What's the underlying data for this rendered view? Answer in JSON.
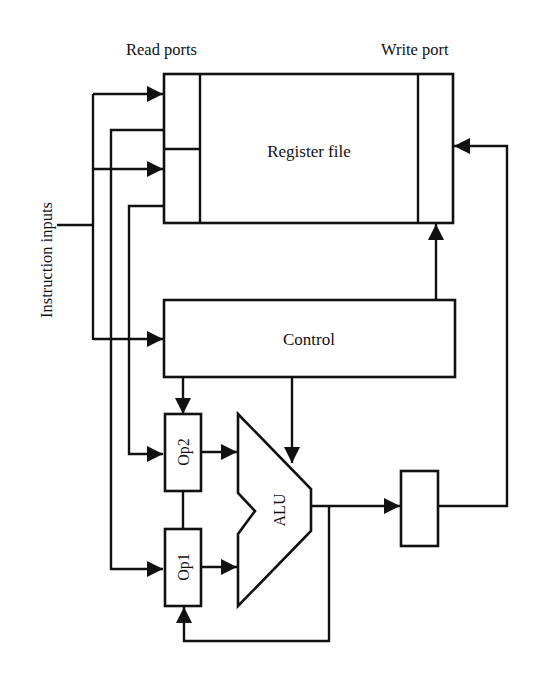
{
  "diagram": {
    "type": "block-diagram",
    "labels": {
      "read_ports": "Read ports",
      "write_port": "Write port",
      "instruction_inputs": "Instruction inputs",
      "register_file": "Register file",
      "control": "Control",
      "op1": "Op1",
      "op2": "Op2",
      "alu": "ALU"
    },
    "colors": {
      "stroke": "#111111",
      "background": "#ffffff"
    },
    "blocks": [
      {
        "id": "register-file",
        "label": "Register file",
        "ports": [
          "read-port-1",
          "read-port-2",
          "write-port"
        ]
      },
      {
        "id": "control",
        "label": "Control"
      },
      {
        "id": "op2",
        "label": "Op2"
      },
      {
        "id": "op1",
        "label": "Op1"
      },
      {
        "id": "alu",
        "label": "ALU"
      },
      {
        "id": "output-register",
        "label": ""
      }
    ],
    "connections": [
      {
        "from": "instruction-inputs",
        "to": "read-port-1"
      },
      {
        "from": "instruction-inputs",
        "to": "read-port-2"
      },
      {
        "from": "instruction-inputs",
        "to": "control"
      },
      {
        "from": "read-port-1",
        "to": "op1"
      },
      {
        "from": "read-port-2",
        "to": "op2"
      },
      {
        "from": "control",
        "to": "op2"
      },
      {
        "from": "control",
        "to": "alu"
      },
      {
        "from": "control",
        "to": "write-port"
      },
      {
        "from": "op2",
        "to": "alu"
      },
      {
        "from": "op1",
        "to": "alu"
      },
      {
        "from": "alu",
        "to": "output-register"
      },
      {
        "from": "alu",
        "to": "op1"
      },
      {
        "from": "output-register",
        "to": "write-port"
      }
    ]
  }
}
